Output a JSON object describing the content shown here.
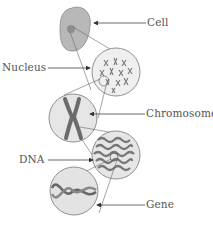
{
  "diagram": {
    "labels": {
      "cell": "Cell",
      "nucleus": "Nucleus",
      "chromosome": "Chromosome",
      "dna": "DNA",
      "gene": "Gene"
    },
    "colors": {
      "cell_fill": "#b5b5b5",
      "circle_fill": "#e6e6e6",
      "chromosome": "#6e6e6e",
      "line": "#555555"
    }
  }
}
